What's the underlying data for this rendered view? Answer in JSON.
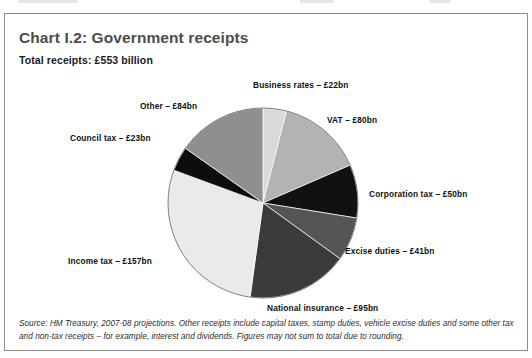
{
  "chart": {
    "title": "Chart I.2: Government receipts",
    "subtitle": "Total receipts: £553 billion",
    "footnote": "Source: HM Treasury, 2007-08 projections. Other receipts include capital taxes, stamp duties, vehicle excise duties and some other tax and non-tax receipts – for example, interest and dividends. Figures may not sum to total due to rounding."
  },
  "labels": {
    "business_rates": "Business rates – £22bn",
    "vat": "VAT – £80bn",
    "corporation_tax": "Corporation tax – £50bn",
    "excise_duties": "Excise duties – £41bn",
    "national_insurance": "National insurance – £95bn",
    "income_tax": "Income tax – £157bn",
    "council_tax": "Council tax – £23bn",
    "other": "Other – £84bn"
  },
  "chart_data": {
    "type": "pie",
    "title": "Chart I.2: Government receipts",
    "subtitle": "Total receipts: £553 billion",
    "unit": "£ billion",
    "total": 553,
    "sum_of_slices": 552,
    "start_angle_deg": 0,
    "direction": "clockwise",
    "legend": "none (direct labels with leader-free placement)",
    "grid": false,
    "categories": [
      "Business rates",
      "VAT",
      "Corporation tax",
      "Excise duties",
      "National insurance",
      "Income tax",
      "Council tax",
      "Other"
    ],
    "values": [
      22,
      80,
      50,
      41,
      95,
      157,
      23,
      84
    ],
    "labels": [
      "Business rates – £22bn",
      "VAT – £80bn",
      "Corporation tax – £50bn",
      "Excise duties – £41bn",
      "National insurance – £95bn",
      "Income tax – £157bn",
      "Council tax – £23bn",
      "Other – £84bn"
    ],
    "percentages": [
      3.99,
      14.49,
      9.06,
      7.43,
      17.21,
      28.44,
      4.17,
      15.22
    ],
    "colors": [
      "#d9d9d9",
      "#b3b3b3",
      "#111111",
      "#555555",
      "#3b3b3b",
      "#eaeaea",
      "#0d0d0d",
      "#8f8f8f"
    ],
    "annotations": [
      "Source: HM Treasury, 2007-08 projections. Other receipts include capital taxes, stamp duties, vehicle excise duties and some other tax and non-tax receipts – for example, interest and dividends. Figures may not sum to total due to rounding."
    ]
  },
  "geometry": {
    "center_x": 258,
    "center_y": 189,
    "radius": 95
  }
}
